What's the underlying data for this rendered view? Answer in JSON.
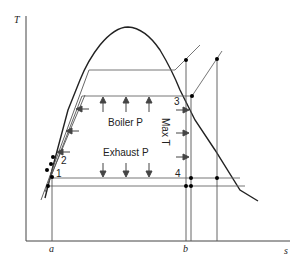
{
  "diagram": {
    "type": "T-s diagram (Rankine cycle)",
    "axes": {
      "y_label": "T",
      "x_label": "s",
      "x_ticks": [
        "a",
        "b"
      ]
    },
    "labels": {
      "boiler": "Boiler P",
      "exhaust": "Exhaust P",
      "max_t": "Max T"
    },
    "points": [
      "1",
      "2",
      "3",
      "4"
    ],
    "colors": {
      "line": "#444444",
      "dome": "#222222",
      "dot": "#000000"
    }
  }
}
